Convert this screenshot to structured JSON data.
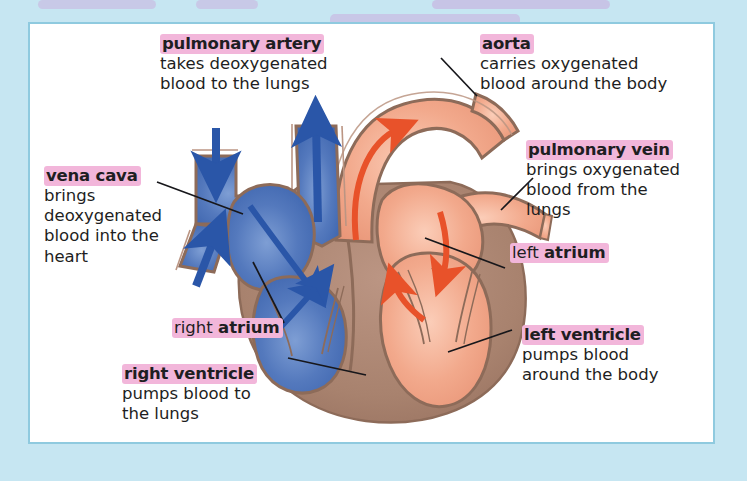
{
  "diagram": {
    "panel": {
      "background": "#ffffff",
      "border_color": "#8fcadf"
    },
    "page_background": "#c6e6f2",
    "colors": {
      "deoxygenated_blood": "#4a72b8",
      "oxygenated_blood": "#f0a385",
      "heart_muscle": "#a8826e",
      "vessel_wall": "#9a7256",
      "blue_arrow": "#2a56a8",
      "red_arrow": "#e8522a",
      "highlight": "#f2b6da",
      "leader_line": "#1a1a1a",
      "text": "#1e1e22"
    }
  },
  "labels": [
    {
      "id": "pulmonary-artery",
      "term": "pulmonary artery",
      "description_lines": [
        "takes deoxygenated",
        "blood to the lungs"
      ],
      "term_style": "bold-highlighted"
    },
    {
      "id": "aorta",
      "term": "aorta",
      "description_lines": [
        "carries oxygenated",
        "blood around the body"
      ],
      "term_style": "bold-highlighted"
    },
    {
      "id": "vena-cava",
      "term": "vena cava",
      "description_lines": [
        "brings",
        "deoxygenated",
        "blood into the",
        "heart"
      ],
      "term_style": "bold-highlighted"
    },
    {
      "id": "pulmonary-vein",
      "term": "pulmonary vein",
      "description_lines": [
        "brings oxygenated",
        "blood from the",
        "lungs"
      ],
      "term_style": "bold-highlighted"
    },
    {
      "id": "left-atrium",
      "term_prefix": "left ",
      "term_bold": "atrium",
      "description_lines": [],
      "term_style": "mixed-highlighted"
    },
    {
      "id": "right-atrium",
      "term_prefix": "right ",
      "term_bold": "atrium",
      "description_lines": [],
      "term_style": "mixed-highlighted"
    },
    {
      "id": "right-ventricle",
      "term": "right ventricle",
      "description_lines": [
        "pumps blood to",
        "the lungs"
      ],
      "term_style": "bold-highlighted"
    },
    {
      "id": "left-ventricle",
      "term": "left ventricle",
      "description_lines": [
        "pumps blood",
        "around the body"
      ],
      "term_style": "bold-highlighted"
    }
  ]
}
